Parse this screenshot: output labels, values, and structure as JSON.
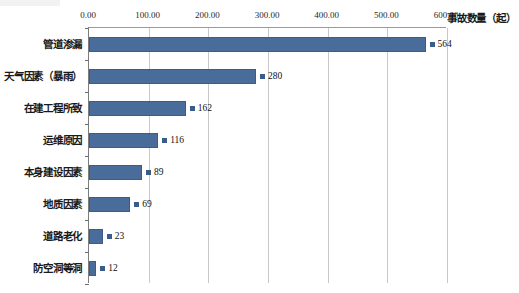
{
  "chart_data": {
    "type": "bar",
    "orientation": "horizontal",
    "title": "",
    "subtitle": "",
    "xlabel": "事故数量（起）",
    "ylabel": "",
    "xlim": [
      0,
      600
    ],
    "grid": true,
    "grid_axis": "x",
    "legend": false,
    "legend_position": "none",
    "series_color": "#4a6c9b",
    "marker_color": "#3b5c8a",
    "categories": [
      "管道渗漏",
      "天气因素（暴雨）",
      "在建工程所致",
      "运维原因",
      "本身建设因素",
      "地质因素",
      "道路老化",
      "防空洞等洞"
    ],
    "values": [
      564,
      280,
      162,
      116,
      89,
      69,
      23,
      12
    ],
    "value_labels": [
      "564",
      "280",
      "162",
      "116",
      "89",
      "69",
      "23",
      "12"
    ],
    "xticks": [
      0,
      100,
      200,
      300,
      400,
      500,
      600
    ],
    "xtick_labels": [
      "0.00",
      "100.00",
      "200.00",
      "300.00",
      "400.00",
      "500.00",
      "600.00"
    ]
  },
  "axis": {
    "title": "事故数量（起）"
  }
}
